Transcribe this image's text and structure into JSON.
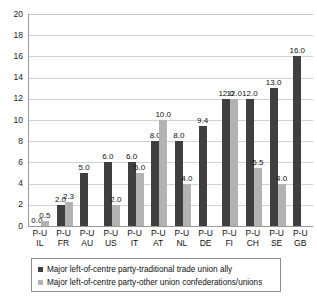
{
  "chart_data": {
    "type": "bar",
    "title": "",
    "xlabel": "",
    "ylabel": "",
    "ylim": [
      0,
      20
    ],
    "ytick_step": 2,
    "yticks": [
      "20",
      "18",
      "16",
      "14",
      "12",
      "10",
      "8",
      "6",
      "4",
      "2",
      "0"
    ],
    "grid": true,
    "legend_position": "bottom",
    "categories": [
      "P-U IL",
      "P-U FR",
      "P-U AU",
      "P-U US",
      "P-U IT",
      "P-U AT",
      "P-U NL",
      "P-U DE",
      "P-U FI",
      "P-U CH",
      "P-U SE",
      "P-U GB"
    ],
    "category_lines": [
      {
        "line1": "P-U",
        "line2": "IL"
      },
      {
        "line1": "P-U",
        "line2": "FR"
      },
      {
        "line1": "P-U",
        "line2": "AU"
      },
      {
        "line1": "P-U",
        "line2": "US"
      },
      {
        "line1": "P-U",
        "line2": "IT"
      },
      {
        "line1": "P-U",
        "line2": "AT"
      },
      {
        "line1": "P-U",
        "line2": "NL"
      },
      {
        "line1": "P-U",
        "line2": "DE"
      },
      {
        "line1": "P-U",
        "line2": "FI"
      },
      {
        "line1": "P-U",
        "line2": "CH"
      },
      {
        "line1": "P-U",
        "line2": "SE"
      },
      {
        "line1": "P-U",
        "line2": "GB"
      }
    ],
    "series": [
      {
        "name": "Major left-of-centre party-traditional trade union ally",
        "color": "#3f3f3f",
        "values": [
          0.0,
          2.0,
          5.0,
          6.0,
          6.0,
          8.0,
          8.0,
          9.4,
          12.0,
          12.0,
          13.0,
          16.0
        ],
        "labels": [
          "0.0",
          "2.0",
          "5.0",
          "6.0",
          "6.0",
          "8.0",
          "8.0",
          "9.4",
          "12.0",
          "12.0",
          "13.0",
          "16.0"
        ]
      },
      {
        "name": "Major left-of-centre party-other union confederations/unions",
        "color": "#b2b2b2",
        "values": [
          0.5,
          2.3,
          null,
          2.0,
          5.0,
          10.0,
          4.0,
          null,
          12.0,
          5.5,
          4.0,
          null
        ],
        "labels": [
          "0.5",
          "2.3",
          "",
          "2.0",
          "5.0",
          "10.0",
          "4.0",
          "",
          "12.0",
          "5.5",
          "4.0",
          ""
        ]
      }
    ]
  },
  "legend": {
    "items": [
      {
        "label": "Major left-of-centre party-traditional trade union ally",
        "color": "#3f3f3f"
      },
      {
        "label": "Major left-of-centre party-other union confederations/unions",
        "color": "#b2b2b2"
      }
    ]
  }
}
